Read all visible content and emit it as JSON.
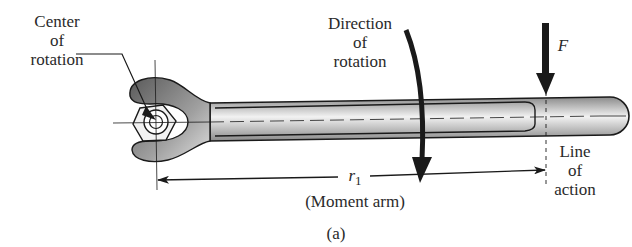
{
  "figure": {
    "caption": "(a)"
  },
  "labels": {
    "center_of_rotation": [
      "Center",
      "of",
      "rotation"
    ],
    "direction_of_rotation": [
      "Direction",
      "of",
      "rotation"
    ],
    "force": "F",
    "line_of_action": [
      "Line",
      "of",
      "action"
    ],
    "moment_arm_symbol": "r",
    "moment_arm_subscript": "1",
    "moment_arm_text": "(Moment arm)"
  },
  "colors": {
    "ink": "#1a1a1a",
    "wrench_dark": "#6e6e6e",
    "wrench_light": "#e6e6e6",
    "background": "#ffffff"
  }
}
